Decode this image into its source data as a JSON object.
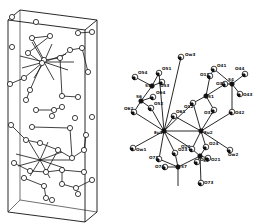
{
  "figure": {
    "left_panel": {
      "description": "crystal packing diagram in unit cell",
      "colors": {
        "stroke": "#111111",
        "background": "#ffffff"
      }
    },
    "right_panel": {
      "description": "molecular structure (ORTEP) with atom labels",
      "atom_labels": [
        {
          "id": "Ow3",
          "text": "Ow3"
        },
        {
          "id": "O54",
          "text": "O54"
        },
        {
          "id": "O51",
          "text": "O51"
        },
        {
          "id": "S5",
          "text": "S5"
        },
        {
          "id": "O53",
          "text": "O53"
        },
        {
          "id": "S6",
          "text": "S6"
        },
        {
          "id": "O64",
          "text": "O64"
        },
        {
          "id": "O62",
          "text": "O62"
        },
        {
          "id": "O52",
          "text": "O52"
        },
        {
          "id": "Eu1",
          "text": "Eu1"
        },
        {
          "id": "Eu2",
          "text": "Eu2"
        },
        {
          "id": "O11",
          "text": "O11"
        },
        {
          "id": "O41",
          "text": "O41"
        },
        {
          "id": "O44",
          "text": "O44"
        },
        {
          "id": "O31",
          "text": "O31"
        },
        {
          "id": "S4",
          "text": "S4"
        },
        {
          "id": "O43",
          "text": "O43"
        },
        {
          "id": "S1",
          "text": "S1"
        },
        {
          "id": "O12",
          "text": "O12"
        },
        {
          "id": "O32",
          "text": "O32"
        },
        {
          "id": "O42",
          "text": "O42"
        },
        {
          "id": "O61",
          "text": "O61"
        },
        {
          "id": "Ow1",
          "text": "Ow1"
        },
        {
          "id": "O71",
          "text": "O71"
        },
        {
          "id": "O23",
          "text": "O23"
        },
        {
          "id": "O22",
          "text": "O22"
        },
        {
          "id": "O24",
          "text": "O24"
        },
        {
          "id": "O21",
          "text": "O21"
        },
        {
          "id": "S2",
          "text": "S2"
        },
        {
          "id": "Ow2",
          "text": "Ow2"
        },
        {
          "id": "O74",
          "text": "O74"
        },
        {
          "id": "S7",
          "text": "S7"
        },
        {
          "id": "O72",
          "text": "O72"
        },
        {
          "id": "O73",
          "text": "O73"
        }
      ]
    }
  }
}
